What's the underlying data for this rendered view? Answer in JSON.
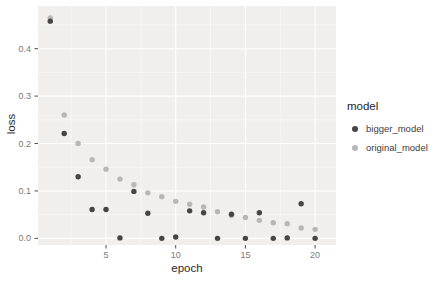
{
  "chart_data": {
    "type": "scatter",
    "title": "",
    "xlabel": "epoch",
    "ylabel": "loss",
    "x": [
      1,
      2,
      3,
      4,
      5,
      6,
      7,
      8,
      9,
      10,
      11,
      12,
      13,
      14,
      15,
      16,
      17,
      18,
      19,
      20
    ],
    "series": [
      {
        "name": "bigger_model",
        "color": "#454545",
        "values": [
          0.458,
          0.221,
          0.13,
          0.061,
          0.061,
          0.001,
          0.099,
          0.053,
          0.0,
          0.003,
          0.058,
          0.054,
          0.0,
          0.051,
          0.0,
          0.054,
          0.0,
          0.001,
          0.073,
          0.0
        ]
      },
      {
        "name": "original_model",
        "color": "#b7b7b7",
        "values": [
          0.465,
          0.26,
          0.2,
          0.166,
          0.146,
          0.125,
          0.113,
          0.096,
          0.088,
          0.078,
          0.072,
          0.066,
          0.056,
          0.048,
          0.044,
          0.038,
          0.033,
          0.031,
          0.022,
          0.019
        ]
      }
    ],
    "x_ticks": {
      "values": [
        5,
        10,
        15,
        20
      ],
      "labels": [
        "5",
        "10",
        "15",
        "20"
      ],
      "minor": [
        2.5,
        7.5,
        12.5,
        17.5
      ]
    },
    "y_ticks": {
      "values": [
        0.0,
        0.1,
        0.2,
        0.3,
        0.4
      ],
      "labels": [
        "0.0",
        "0.1",
        "0.2",
        "0.3",
        "0.4"
      ],
      "minor": [
        0.05,
        0.15,
        0.25,
        0.35,
        0.45
      ]
    },
    "xlim": [
      0.12,
      21.5
    ],
    "ylim": [
      -0.014,
      0.49
    ],
    "grid": true,
    "legend": {
      "title": "model",
      "position": "right"
    },
    "colors": {
      "panel_bg": "#f0efed",
      "grid_major": "#ffffff",
      "grid_minor": "rgba(255,255,255,0.65)",
      "tick_mark": "#4d4d4d",
      "tick_label": "#7b7b7b"
    }
  }
}
